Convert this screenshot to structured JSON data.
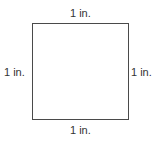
{
  "diagram": {
    "shape": "square",
    "stroke_color": "#4a4a4a",
    "labels": {
      "top": "1 in.",
      "bottom": "1 in.",
      "left": "1 in.",
      "right": "1 in."
    }
  }
}
